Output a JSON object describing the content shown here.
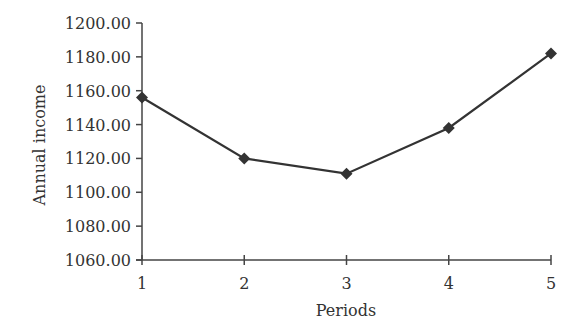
{
  "chart_data": {
    "type": "line",
    "title": "",
    "xlabel": "Periods",
    "ylabel": "Annual income",
    "categories": [
      "1",
      "2",
      "3",
      "4",
      "5"
    ],
    "x": [
      1,
      2,
      3,
      4,
      5
    ],
    "series": [
      {
        "name": "Annual income",
        "values": [
          1156,
          1120,
          1111,
          1138,
          1182
        ],
        "marker": "diamond",
        "color": "#333333"
      }
    ],
    "ylim": [
      1060,
      1200
    ],
    "yticks": [
      1060,
      1080,
      1100,
      1120,
      1140,
      1160,
      1180,
      1200
    ],
    "ytick_labels": [
      "1060.00",
      "1080.00",
      "1100.00",
      "1120.00",
      "1140.00",
      "1160.00",
      "1180.00",
      "1200.00"
    ],
    "xticks": [
      "1",
      "2",
      "3",
      "4",
      "5"
    ],
    "grid": false,
    "legend": null
  },
  "colors": {
    "line": "#333333",
    "axis": "#444444",
    "text": "#333333",
    "background": "#ffffff"
  }
}
